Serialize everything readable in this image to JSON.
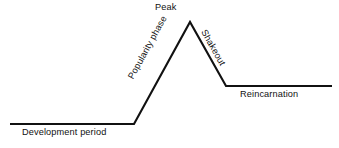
{
  "figure": {
    "kind": "lifecycle-curve-diagram",
    "background_color": "#ffffff",
    "stroke_color": "#111111",
    "text_color": "#111111"
  },
  "labels": {
    "development_period": "Development period",
    "popularity_phase": "Popularity phase",
    "peak": "Peak",
    "shakeout": "Shakeout",
    "reincarnation": "Reincarnation"
  },
  "chart_data": {
    "type": "line",
    "title": "",
    "subtitle": "",
    "xlabel": "",
    "ylabel": "",
    "grid": false,
    "legend_position": "none",
    "axis_visible": false,
    "xlim": [
      0,
      339
    ],
    "ylim": [
      0,
      148
    ],
    "series": [
      {
        "name": "lifecycle-curve",
        "points": [
          {
            "x": 10,
            "y": 124,
            "phase": "Development period"
          },
          {
            "x": 134,
            "y": 124,
            "phase": "Development period"
          },
          {
            "x": 190,
            "y": 22,
            "phase": "Peak"
          },
          {
            "x": 226,
            "y": 86,
            "phase": "Shakeout"
          },
          {
            "x": 332,
            "y": 86,
            "phase": "Reincarnation"
          }
        ]
      }
    ],
    "segments": [
      {
        "name": "Development period",
        "from": [
          10,
          124
        ],
        "to": [
          134,
          124
        ],
        "slope": "flat"
      },
      {
        "name": "Popularity phase",
        "from": [
          134,
          124
        ],
        "to": [
          190,
          22
        ],
        "slope": "rising"
      },
      {
        "name": "Shakeout",
        "from": [
          190,
          22
        ],
        "to": [
          226,
          86
        ],
        "slope": "falling"
      },
      {
        "name": "Reincarnation",
        "from": [
          226,
          86
        ],
        "to": [
          332,
          86
        ],
        "slope": "flat"
      }
    ],
    "annotations": [
      {
        "text": "Development period",
        "x": 22,
        "y": 134,
        "rotation": 0
      },
      {
        "text": "Popularity phase",
        "x": 131,
        "y": 78,
        "rotation": -61.3
      },
      {
        "text": "Peak",
        "x": 155,
        "y": 9,
        "rotation": 0
      },
      {
        "text": "Shakeout",
        "x": 203,
        "y": 31,
        "rotation": 60.5
      },
      {
        "text": "Reincarnation",
        "x": 240,
        "y": 96,
        "rotation": 0
      }
    ],
    "path_d": "M 10 124 L 134 124 L 190 22 L 226 86 L 332 86"
  }
}
